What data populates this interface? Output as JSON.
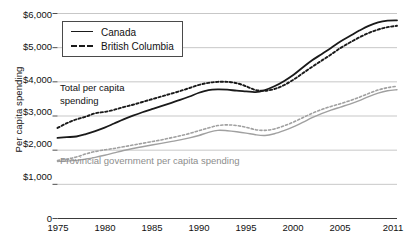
{
  "chart_data": {
    "type": "line",
    "title": "",
    "xlabel": "",
    "ylabel": "Per capita spending",
    "xlim": [
      1975,
      2011
    ],
    "ylim": [
      0,
      6000
    ],
    "grid": true,
    "legend_position": "top-left",
    "y_ticks": [
      "0",
      "$1,000",
      "$2,000",
      "$3,000",
      "$4,000",
      "$5,000",
      "$6,000"
    ],
    "y_tick_values": [
      0,
      1000,
      2000,
      3000,
      4000,
      5000,
      6000
    ],
    "x_ticks": [
      "1975",
      "1980",
      "1985",
      "1990",
      "1995",
      "2000",
      "2005",
      "2011"
    ],
    "x_tick_values": [
      1975,
      1980,
      1985,
      1990,
      1995,
      2000,
      2005,
      2011
    ],
    "legend": [
      {
        "label": "Canada",
        "style": "solid"
      },
      {
        "label": "British Columbia",
        "style": "dotted"
      }
    ],
    "annotations": [
      {
        "text": "Total per capita\nspending",
        "color": "#111111"
      },
      {
        "text": "Provincial government per capita spending",
        "color": "#8d8d8d"
      }
    ],
    "x": [
      1975,
      1976,
      1977,
      1978,
      1979,
      1980,
      1981,
      1982,
      1983,
      1984,
      1985,
      1986,
      1987,
      1988,
      1989,
      1990,
      1991,
      1992,
      1993,
      1994,
      1995,
      1996,
      1997,
      1998,
      1999,
      2000,
      2001,
      2002,
      2003,
      2004,
      2005,
      2006,
      2007,
      2008,
      2009,
      2010,
      2011
    ],
    "series": [
      {
        "name": "Canada - Total per capita spending",
        "group": "total",
        "region": "Canada",
        "style": "solid",
        "color": "#1a1a1a",
        "values": [
          2360,
          2380,
          2400,
          2470,
          2560,
          2660,
          2780,
          2900,
          3010,
          3110,
          3200,
          3290,
          3380,
          3470,
          3570,
          3680,
          3760,
          3780,
          3770,
          3740,
          3720,
          3700,
          3760,
          3870,
          4020,
          4200,
          4420,
          4630,
          4810,
          4990,
          5180,
          5340,
          5500,
          5640,
          5740,
          5790,
          5800
        ]
      },
      {
        "name": "British Columbia - Total per capita spending",
        "group": "total",
        "region": "British Columbia",
        "style": "dotted",
        "color": "#1a1a1a",
        "values": [
          2650,
          2790,
          2900,
          2980,
          3080,
          3120,
          3180,
          3260,
          3330,
          3410,
          3490,
          3570,
          3650,
          3730,
          3820,
          3910,
          3970,
          4000,
          4000,
          3960,
          3870,
          3760,
          3740,
          3790,
          3900,
          4060,
          4250,
          4440,
          4620,
          4800,
          4990,
          5150,
          5300,
          5430,
          5530,
          5600,
          5640
        ]
      },
      {
        "name": "Canada - Provincial government per capita spending",
        "group": "provincial",
        "region": "Canada",
        "style": "solid",
        "color": "#a0a0a0",
        "values": [
          1670,
          1680,
          1700,
          1740,
          1790,
          1850,
          1920,
          1990,
          2050,
          2100,
          2150,
          2200,
          2250,
          2300,
          2360,
          2430,
          2520,
          2580,
          2570,
          2540,
          2500,
          2450,
          2430,
          2480,
          2570,
          2680,
          2810,
          2950,
          3070,
          3170,
          3260,
          3350,
          3450,
          3570,
          3670,
          3740,
          3770
        ]
      },
      {
        "name": "British Columbia - Provincial government per capita spending",
        "group": "provincial",
        "region": "British Columbia",
        "style": "dotted",
        "color": "#a0a0a0",
        "values": [
          1700,
          1740,
          1800,
          1890,
          1960,
          2010,
          2050,
          2100,
          2150,
          2200,
          2250,
          2300,
          2360,
          2420,
          2490,
          2570,
          2650,
          2720,
          2740,
          2720,
          2670,
          2600,
          2580,
          2620,
          2710,
          2820,
          2950,
          3080,
          3190,
          3280,
          3360,
          3450,
          3550,
          3660,
          3760,
          3830,
          3870
        ]
      }
    ]
  },
  "source_note": ""
}
